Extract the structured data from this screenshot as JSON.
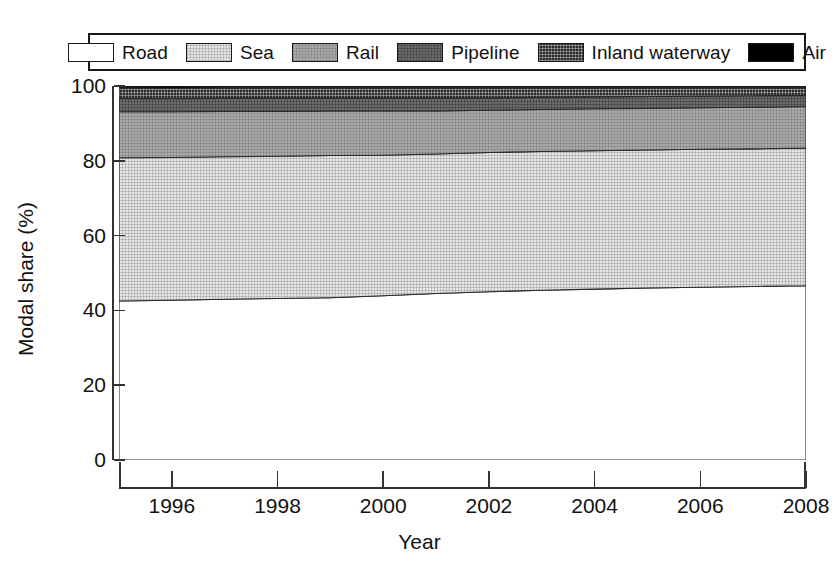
{
  "chart_data": {
    "type": "area",
    "stacked": true,
    "title": "",
    "xlabel": "Year",
    "ylabel": "Modal share (%)",
    "xlim": [
      1995,
      2008
    ],
    "ylim": [
      0,
      100
    ],
    "grid": false,
    "legend_position": "top",
    "x": [
      1995,
      1996,
      1997,
      1998,
      1999,
      2000,
      2001,
      2002,
      2003,
      2004,
      2005,
      2006,
      2007,
      2008
    ],
    "xticks": [
      1996,
      1998,
      2000,
      2002,
      2004,
      2006,
      2008
    ],
    "xtick_labels": [
      "1996",
      "1998",
      "2000",
      "2002",
      "2004",
      "2006",
      "2008"
    ],
    "yticks": [
      0,
      20,
      40,
      60,
      80,
      100
    ],
    "ytick_labels": [
      "0",
      "20",
      "40",
      "60",
      "80",
      "100"
    ],
    "series": [
      {
        "name": "Road",
        "color": "#ffffff",
        "pattern": "solid-white",
        "values": [
          42.5,
          42.7,
          43.0,
          43.2,
          43.4,
          43.9,
          44.5,
          45.0,
          45.4,
          45.7,
          46.0,
          46.2,
          46.4,
          46.6
        ]
      },
      {
        "name": "Sea",
        "color": "#e3e3e3",
        "pattern": "fine-grid-light",
        "values": [
          38.3,
          38.2,
          38.1,
          38.0,
          38.0,
          37.6,
          37.3,
          37.2,
          37.1,
          37.0,
          36.9,
          36.9,
          36.8,
          36.8
        ]
      },
      {
        "name": "Rail",
        "color": "#a9a9a9",
        "pattern": "fine-grid-medium",
        "values": [
          12.3,
          12.2,
          12.1,
          12.0,
          11.9,
          11.8,
          11.5,
          11.3,
          11.2,
          11.2,
          11.1,
          11.1,
          11.1,
          11.1
        ]
      },
      {
        "name": "Pipeline",
        "color": "#6b6b6b",
        "pattern": "fine-grid-dark",
        "values": [
          3.6,
          3.5,
          3.5,
          3.5,
          3.4,
          3.4,
          3.4,
          3.3,
          3.3,
          3.2,
          3.2,
          3.1,
          3.1,
          3.0
        ]
      },
      {
        "name": "Inland waterway",
        "color": "#2b2b2b",
        "pattern": "dense-dither",
        "values": [
          2.8,
          2.8,
          2.8,
          2.8,
          2.8,
          2.8,
          2.8,
          2.7,
          2.5,
          2.4,
          2.3,
          2.2,
          2.1,
          2.0
        ]
      },
      {
        "name": "Air",
        "color": "#000000",
        "pattern": "solid-black",
        "values": [
          0.5,
          0.6,
          0.5,
          0.5,
          0.5,
          0.5,
          0.5,
          0.5,
          0.5,
          0.5,
          0.5,
          0.5,
          0.5,
          0.5
        ]
      }
    ]
  },
  "legend": {
    "items": [
      {
        "label": "Road"
      },
      {
        "label": "Sea"
      },
      {
        "label": "Rail"
      },
      {
        "label": "Pipeline"
      },
      {
        "label": "Inland waterway"
      },
      {
        "label": "Air"
      }
    ]
  },
  "axes": {
    "x_title": "Year",
    "y_title": "Modal share (%)"
  }
}
